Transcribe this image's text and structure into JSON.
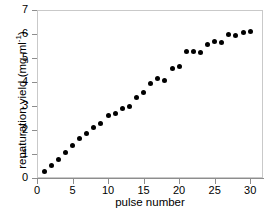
{
  "chart_data": {
    "type": "scatter",
    "title": "",
    "xlabel": "pulse number",
    "ylabel": "renaturation yield (mg ml-1)",
    "ylabel_main": "renaturation yield (mg ml",
    "ylabel_sup": "-1",
    "ylabel_tail": ")",
    "xlim": [
      0,
      31.8
    ],
    "ylim": [
      0,
      7
    ],
    "xticks": [
      0,
      5,
      10,
      15,
      20,
      25,
      30
    ],
    "yticks": [
      0,
      1,
      2,
      3,
      4,
      5,
      6,
      7
    ],
    "xtick_labels": [
      "0",
      "5",
      "10",
      "15",
      "20",
      "25",
      "30"
    ],
    "ytick_labels": [
      "0",
      "1",
      "2",
      "3",
      "4",
      "5",
      "6",
      "7"
    ],
    "grid": false,
    "legend": false,
    "marker": "filled-circle",
    "marker_color": "#000000",
    "x": [
      1,
      2,
      3,
      4,
      5,
      6,
      7,
      8,
      9,
      10,
      11,
      12,
      13,
      14,
      15,
      16,
      17,
      18,
      19,
      20,
      21,
      22,
      23,
      24,
      25,
      26,
      27,
      28,
      29,
      30
    ],
    "values": [
      0.29,
      0.51,
      0.77,
      1.07,
      1.37,
      1.65,
      1.85,
      2.12,
      2.27,
      2.6,
      2.68,
      2.9,
      3.0,
      3.34,
      3.55,
      3.93,
      4.15,
      4.07,
      4.56,
      4.66,
      5.26,
      5.27,
      5.25,
      5.57,
      5.7,
      5.64,
      6.0,
      5.93,
      6.08,
      6.1
    ]
  }
}
